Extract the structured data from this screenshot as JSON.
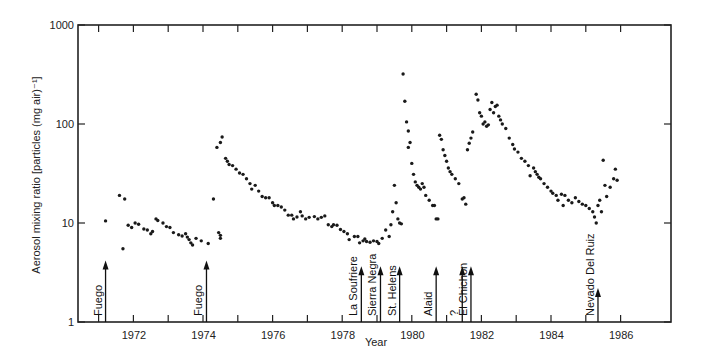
{
  "chart_data": {
    "type": "scatter",
    "title": "",
    "xlabel": "Year",
    "ylabel": "Aerosol mixing ratio [particles (mg air)⁻¹]",
    "yscale": "log",
    "ylim": [
      1,
      1000
    ],
    "xlim": [
      1970.6,
      1987.6
    ],
    "grid": false,
    "legend": null,
    "y_ticks": [
      {
        "value": 1,
        "label": "1"
      },
      {
        "value": 10,
        "label": "10"
      },
      {
        "value": 100,
        "label": "100"
      },
      {
        "value": 1000,
        "label": "1000"
      }
    ],
    "x_tick_labels": [
      {
        "year": 1972,
        "label": "1972"
      },
      {
        "year": 1974,
        "label": "1974"
      },
      {
        "year": 1976,
        "label": "1976"
      },
      {
        "year": 1978,
        "label": "1978"
      },
      {
        "year": 1980,
        "label": "1980"
      },
      {
        "year": 1982,
        "label": "1982"
      },
      {
        "year": 1984,
        "label": "1984"
      },
      {
        "year": 1986,
        "label": "1986"
      }
    ],
    "x_minor_ticks": [
      1971.5,
      1972.5,
      1973.5,
      1974.5,
      1975.5,
      1976.5,
      1977.5,
      1978.5,
      1979.5,
      1980.5,
      1981.5,
      1982.5,
      1983.5,
      1984.5,
      1985.5,
      1986.5
    ],
    "eruptions": [
      {
        "name": "Fuego",
        "year": 1971.2,
        "arrow_top": 4.0
      },
      {
        "name": "Fuego",
        "year": 1974.1,
        "arrow_top": 4.0
      },
      {
        "name": "La Soufriere",
        "year": 1978.55,
        "arrow_top": 3.5
      },
      {
        "name": "Sierra Negra",
        "year": 1979.1,
        "arrow_top": 3.5
      },
      {
        "name": "St. Helens",
        "year": 1979.65,
        "arrow_top": 3.5
      },
      {
        "name": "Alaid",
        "year": 1980.7,
        "arrow_top": 3.5
      },
      {
        "name": "?",
        "year": 1981.45,
        "arrow_top": 3.5
      },
      {
        "name": "El Chichon",
        "year": 1981.7,
        "arrow_top": 3.5
      },
      {
        "name": "Nevado Del Ruiz",
        "year": 1985.35,
        "arrow_top": 2.1
      }
    ],
    "points": [
      [
        1971.2,
        10.5
      ],
      [
        1971.6,
        19
      ],
      [
        1971.75,
        17.5
      ],
      [
        1971.7,
        5.5
      ],
      [
        1971.85,
        9.5
      ],
      [
        1971.95,
        9
      ],
      [
        1972.05,
        10
      ],
      [
        1972.15,
        9.7
      ],
      [
        1972.3,
        8.7
      ],
      [
        1972.4,
        8.5
      ],
      [
        1972.5,
        7.8
      ],
      [
        1972.55,
        8.2
      ],
      [
        1972.65,
        11
      ],
      [
        1972.7,
        10.6
      ],
      [
        1972.85,
        10
      ],
      [
        1972.95,
        9.2
      ],
      [
        1973.05,
        9
      ],
      [
        1973.15,
        8
      ],
      [
        1973.3,
        7.6
      ],
      [
        1973.4,
        7.4
      ],
      [
        1973.5,
        7.8
      ],
      [
        1973.55,
        7.2
      ],
      [
        1973.6,
        6.8
      ],
      [
        1973.65,
        6.3
      ],
      [
        1973.7,
        6
      ],
      [
        1973.8,
        7
      ],
      [
        1973.95,
        6.6
      ],
      [
        1974.15,
        6.2
      ],
      [
        1974.3,
        17.5
      ],
      [
        1974.4,
        58
      ],
      [
        1974.5,
        65
      ],
      [
        1974.55,
        74
      ],
      [
        1974.45,
        8
      ],
      [
        1974.5,
        7.5
      ],
      [
        1974.5,
        7
      ],
      [
        1974.65,
        45
      ],
      [
        1974.7,
        42
      ],
      [
        1974.75,
        39
      ],
      [
        1974.85,
        38
      ],
      [
        1974.95,
        35
      ],
      [
        1975.05,
        32
      ],
      [
        1975.15,
        31
      ],
      [
        1975.25,
        28
      ],
      [
        1975.35,
        25
      ],
      [
        1975.4,
        22
      ],
      [
        1975.5,
        24
      ],
      [
        1975.6,
        21
      ],
      [
        1975.7,
        18.5
      ],
      [
        1975.8,
        18
      ],
      [
        1975.9,
        18
      ],
      [
        1976.0,
        16
      ],
      [
        1976.05,
        15
      ],
      [
        1976.15,
        15
      ],
      [
        1976.25,
        14.5
      ],
      [
        1976.35,
        13.5
      ],
      [
        1976.45,
        12
      ],
      [
        1976.55,
        12
      ],
      [
        1976.6,
        11
      ],
      [
        1976.7,
        11.5
      ],
      [
        1976.8,
        13
      ],
      [
        1976.85,
        11.8
      ],
      [
        1976.95,
        11
      ],
      [
        1977.05,
        11.4
      ],
      [
        1977.2,
        11.6
      ],
      [
        1977.3,
        11
      ],
      [
        1977.4,
        11.4
      ],
      [
        1977.5,
        11.8
      ],
      [
        1977.6,
        9.6
      ],
      [
        1977.7,
        9.2
      ],
      [
        1977.75,
        9.6
      ],
      [
        1977.85,
        9.5
      ],
      [
        1977.95,
        8.6
      ],
      [
        1978.05,
        8.2
      ],
      [
        1978.15,
        7.8
      ],
      [
        1978.2,
        6.8
      ],
      [
        1978.35,
        7.3
      ],
      [
        1978.45,
        7.3
      ],
      [
        1978.5,
        6.3
      ],
      [
        1978.6,
        6.6
      ],
      [
        1978.65,
        6.9
      ],
      [
        1978.7,
        6.5
      ],
      [
        1978.8,
        6.4
      ],
      [
        1978.9,
        6.6
      ],
      [
        1979.0,
        6.5
      ],
      [
        1979.05,
        6.2
      ],
      [
        1979.15,
        7
      ],
      [
        1979.25,
        8.5
      ],
      [
        1979.35,
        7.3
      ],
      [
        1979.4,
        9.6
      ],
      [
        1979.45,
        13
      ],
      [
        1979.5,
        24
      ],
      [
        1979.55,
        16
      ],
      [
        1979.6,
        11
      ],
      [
        1979.65,
        10
      ],
      [
        1979.7,
        9.8
      ],
      [
        1979.75,
        320
      ],
      [
        1979.8,
        170
      ],
      [
        1979.85,
        105
      ],
      [
        1979.9,
        85
      ],
      [
        1979.95,
        65
      ],
      [
        1979.9,
        58
      ],
      [
        1980.0,
        40
      ],
      [
        1980.05,
        31
      ],
      [
        1980.1,
        26
      ],
      [
        1980.15,
        24
      ],
      [
        1980.2,
        23
      ],
      [
        1980.25,
        22
      ],
      [
        1980.3,
        25
      ],
      [
        1980.35,
        23
      ],
      [
        1980.4,
        19
      ],
      [
        1980.5,
        17
      ],
      [
        1980.6,
        15
      ],
      [
        1980.65,
        15
      ],
      [
        1980.7,
        11
      ],
      [
        1980.75,
        11
      ],
      [
        1980.8,
        77
      ],
      [
        1980.85,
        70
      ],
      [
        1980.9,
        55
      ],
      [
        1980.95,
        48
      ],
      [
        1981.0,
        42
      ],
      [
        1981.05,
        36
      ],
      [
        1981.1,
        33
      ],
      [
        1981.15,
        31
      ],
      [
        1981.25,
        28
      ],
      [
        1981.35,
        25
      ],
      [
        1981.45,
        17.5
      ],
      [
        1981.5,
        18
      ],
      [
        1981.55,
        15.5
      ],
      [
        1981.6,
        55
      ],
      [
        1981.65,
        64
      ],
      [
        1981.7,
        72
      ],
      [
        1981.75,
        83
      ],
      [
        1981.85,
        200
      ],
      [
        1981.9,
        175
      ],
      [
        1981.95,
        130
      ],
      [
        1982.0,
        120
      ],
      [
        1982.05,
        100
      ],
      [
        1982.1,
        105
      ],
      [
        1982.15,
        95
      ],
      [
        1982.2,
        98
      ],
      [
        1982.25,
        140
      ],
      [
        1982.3,
        165
      ],
      [
        1982.35,
        130
      ],
      [
        1982.4,
        150
      ],
      [
        1982.45,
        155
      ],
      [
        1982.5,
        120
      ],
      [
        1982.55,
        110
      ],
      [
        1982.6,
        100
      ],
      [
        1982.7,
        90
      ],
      [
        1982.8,
        72
      ],
      [
        1982.9,
        62
      ],
      [
        1982.95,
        56
      ],
      [
        1983.05,
        52
      ],
      [
        1983.15,
        45
      ],
      [
        1983.25,
        42
      ],
      [
        1983.35,
        38
      ],
      [
        1983.4,
        30
      ],
      [
        1983.5,
        36
      ],
      [
        1983.55,
        33
      ],
      [
        1983.6,
        31
      ],
      [
        1983.65,
        29
      ],
      [
        1983.7,
        28
      ],
      [
        1983.8,
        25
      ],
      [
        1983.9,
        23
      ],
      [
        1984.0,
        21
      ],
      [
        1984.05,
        20
      ],
      [
        1984.15,
        19
      ],
      [
        1984.2,
        17
      ],
      [
        1984.3,
        19.5
      ],
      [
        1984.35,
        15
      ],
      [
        1984.4,
        19
      ],
      [
        1984.5,
        17
      ],
      [
        1984.6,
        16
      ],
      [
        1984.7,
        18
      ],
      [
        1984.8,
        16.5
      ],
      [
        1984.9,
        15.5
      ],
      [
        1985.0,
        15
      ],
      [
        1985.1,
        14
      ],
      [
        1985.2,
        13
      ],
      [
        1985.25,
        11.5
      ],
      [
        1985.3,
        10
      ],
      [
        1985.35,
        15
      ],
      [
        1985.4,
        17
      ],
      [
        1985.45,
        13
      ],
      [
        1985.5,
        43
      ],
      [
        1985.55,
        24
      ],
      [
        1985.6,
        18.5
      ],
      [
        1985.7,
        23
      ],
      [
        1985.8,
        28
      ],
      [
        1985.85,
        35
      ],
      [
        1985.9,
        27
      ]
    ]
  },
  "axes": {
    "y_label": "Aerosol mixing ratio [particles (mg air)⁻¹]",
    "x_label": "Year"
  }
}
